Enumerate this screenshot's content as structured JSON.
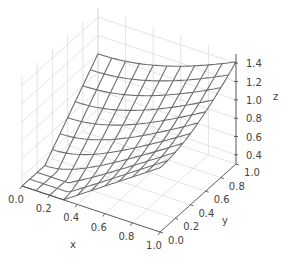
{
  "chart_data": {
    "type": "surface-wireframe",
    "title": "",
    "xlabel": "x",
    "ylabel": "y",
    "zlabel": "z",
    "xlim": [
      0.0,
      1.0
    ],
    "ylim": [
      0.0,
      1.0
    ],
    "zlim": [
      0.3,
      1.5
    ],
    "x_ticks": [
      "0.0",
      "0.2",
      "0.4",
      "0.6",
      "0.8",
      "1.0"
    ],
    "y_ticks": [
      "0.0",
      "0.2",
      "0.4",
      "0.6",
      "0.8",
      "1.0"
    ],
    "z_ticks": [
      "0.4",
      "0.6",
      "0.8",
      "1.0",
      "1.2",
      "1.4"
    ],
    "grid": true,
    "grid_resolution": 11,
    "surface_function": "z = sqrt(x^2 + y^2)",
    "corner_values": {
      "x0_y0": 0.3,
      "x1_y0": 1.0,
      "x0_y1": 1.0,
      "x1_y1": 1.41
    },
    "wire_color": "#6e6e6e",
    "pane_grid_color": "#dcdcdc"
  }
}
